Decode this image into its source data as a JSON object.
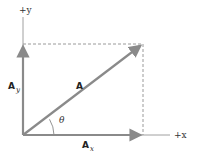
{
  "diagram": {
    "axes": {
      "x_label": "+x",
      "y_label": "+y"
    },
    "vectors": {
      "resultant": {
        "label": "A"
      },
      "x_component": {
        "label": "A",
        "subscript": "x"
      },
      "y_component": {
        "label": "A",
        "subscript": "y"
      }
    },
    "angle": {
      "label": "θ"
    },
    "colors": {
      "vector": "#8a8a8a",
      "axis": "#9a9a9a",
      "dashed": "#9a9a9a",
      "text": "#222222"
    }
  }
}
